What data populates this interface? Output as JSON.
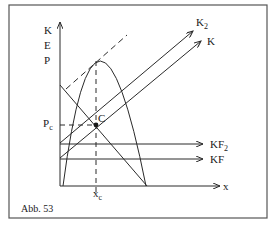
{
  "figure": {
    "caption": "Abb. 53",
    "y_axis_label_lines": [
      "K",
      "E",
      "P"
    ],
    "x_axis_label": "x",
    "point_label": "C",
    "price_label": "P",
    "price_label_sub": "c",
    "quantity_label": "x",
    "quantity_label_sub": "c",
    "curves": {
      "k2": {
        "label": "K",
        "sub": "2"
      },
      "k": {
        "label": "K",
        "sub": ""
      },
      "kf2": {
        "label": "KF",
        "sub": "2"
      },
      "kf": {
        "label": "KF",
        "sub": ""
      }
    }
  },
  "colors": {
    "line": "#2a2a2a",
    "frame": "#555555",
    "background": "#ffffff"
  }
}
